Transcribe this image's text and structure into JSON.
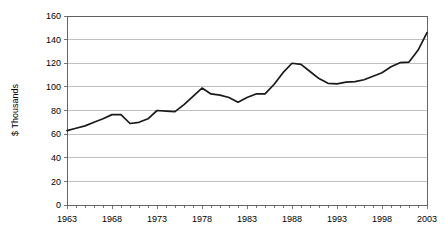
{
  "chart_data": {
    "type": "line",
    "title": "",
    "subtitle": "",
    "xlabel": "",
    "ylabel": "$ Thousands",
    "xlim": [
      1963,
      2003
    ],
    "ylim": [
      0,
      160
    ],
    "ytick_step": 20,
    "xtick_step": 5,
    "grid": "horizontal",
    "legend": "none",
    "yticks": [
      0,
      20,
      40,
      60,
      80,
      100,
      120,
      140,
      160
    ],
    "ytick_labels": [
      "0",
      "20",
      "40",
      "60",
      "80",
      "100",
      "120",
      "140",
      "160"
    ],
    "xticks": [
      1963,
      1968,
      1973,
      1978,
      1983,
      1988,
      1993,
      1998,
      2003
    ],
    "xtick_labels": [
      "1963",
      "1968",
      "1973",
      "1978",
      "1983",
      "1988",
      "1993",
      "1998",
      "2003"
    ],
    "minor_xticks_every": 1,
    "line_color": "#1a1a1a",
    "grid_color": "#a6a6a6",
    "axis_color": "#555555",
    "background_color": "#ffffff",
    "categories": [
      1963,
      1964,
      1965,
      1966,
      1967,
      1968,
      1969,
      1970,
      1971,
      1972,
      1973,
      1974,
      1975,
      1976,
      1977,
      1978,
      1979,
      1980,
      1981,
      1982,
      1983,
      1984,
      1985,
      1986,
      1987,
      1988,
      1989,
      1990,
      1991,
      1992,
      1993,
      1994,
      1995,
      1996,
      1997,
      1998,
      1999,
      2000,
      2001,
      2002,
      2003
    ],
    "values": [
      63,
      65,
      67,
      70,
      73,
      76.5,
      76.5,
      69,
      70,
      73,
      80,
      79.5,
      79,
      85,
      92,
      99,
      94,
      93,
      91,
      87,
      91,
      94,
      94,
      102,
      112,
      120,
      119,
      113,
      107,
      103,
      102.5,
      104,
      104.5,
      106,
      109,
      112,
      117,
      120.5,
      121,
      131,
      146
    ],
    "series": [
      {
        "name": "Median value",
        "values": [
          63,
          65,
          67,
          70,
          73,
          76.5,
          76.5,
          69,
          70,
          73,
          80,
          79.5,
          79,
          85,
          92,
          99,
          94,
          93,
          91,
          87,
          91,
          94,
          94,
          102,
          112,
          120,
          119,
          113,
          107,
          103,
          102.5,
          104,
          104.5,
          106,
          109,
          112,
          117,
          120.5,
          121,
          131,
          146
        ]
      }
    ],
    "annotations": []
  },
  "layout": {
    "plot_left": 67,
    "plot_right": 427,
    "plot_top": 16,
    "plot_bottom": 205
  }
}
